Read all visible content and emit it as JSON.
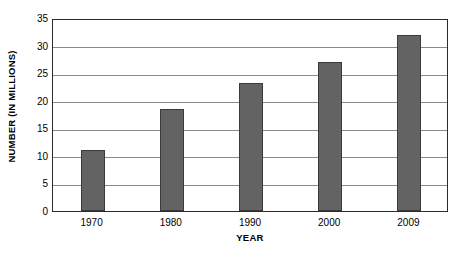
{
  "chart_data": {
    "type": "bar",
    "title": "",
    "xlabel": "YEAR",
    "ylabel": "NUMBER (IN MILLIONS)",
    "categories": [
      "1970",
      "1980",
      "1990",
      "2000",
      "2009"
    ],
    "values": [
      11,
      18.5,
      23.3,
      27,
      32
    ],
    "series": [
      {
        "name": "Number (in millions)",
        "values": [
          11,
          18.5,
          23.3,
          27,
          32
        ]
      }
    ],
    "ylim": [
      0,
      35
    ],
    "yticks": [
      0,
      5,
      10,
      15,
      20,
      25,
      30,
      35
    ],
    "ytick_labels": [
      "0",
      "5",
      "10",
      "15",
      "20",
      "25",
      "30",
      "35"
    ],
    "grid": "horizontal",
    "legend": "none",
    "bar_color": "#636363",
    "bar_edge_color": "#3b3b3b",
    "gridline_color": "#8a8a8a",
    "frame_color": "#2b2b2b",
    "background_color": "#ffffff"
  }
}
